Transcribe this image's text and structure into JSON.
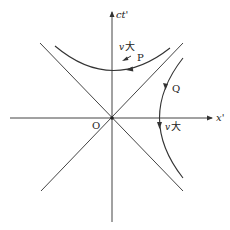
{
  "diagram": {
    "type": "spacetime-hyperbola",
    "axes": {
      "vertical_label": "ct'",
      "horizontal_label": "x'",
      "origin_label": "O"
    },
    "curves": [
      {
        "id": "P",
        "label": "P",
        "annotation": "v 大",
        "description": "upper hyperbola (timelike)"
      },
      {
        "id": "Q",
        "label": "Q",
        "annotation": "v 大",
        "description": "right hyperbola (spacelike)"
      }
    ],
    "colors": {
      "line": "#333333",
      "background": "#ffffff"
    }
  },
  "labels": {
    "ct": "ct'",
    "x": "x'",
    "origin": "O",
    "p": "P",
    "q": "Q",
    "p_v": "v",
    "p_big": "大",
    "q_v": "v",
    "q_big": "大"
  }
}
